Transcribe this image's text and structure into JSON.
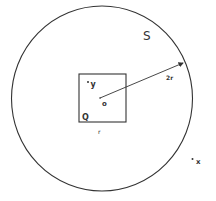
{
  "diagram": {
    "region_label": "S",
    "square_label": "Q",
    "square_side_label": "r",
    "center_label": "o",
    "radius_label": "2r",
    "inner_point_label": "y",
    "outer_point_label": "x",
    "stroke_color": "#333333",
    "background": "#ffffff"
  }
}
